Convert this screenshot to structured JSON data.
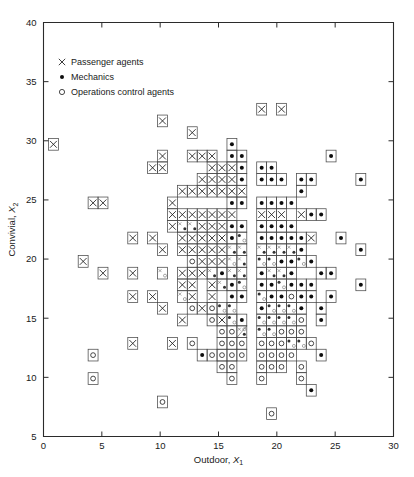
{
  "figure": {
    "kind": "scatter-plot",
    "background": "#ffffff"
  },
  "axes": {
    "x": {
      "label_text": "Outdoor, ",
      "label_var": "X",
      "label_sub": "1",
      "min": 0,
      "max": 30,
      "ticks": [
        0,
        5,
        10,
        15,
        20,
        25,
        30
      ],
      "ticklabels": [
        "0",
        "5",
        "10",
        "15",
        "20",
        "25",
        "30"
      ]
    },
    "y": {
      "label_text": "Convivial, ",
      "label_var": "X",
      "label_sub": "2",
      "min": 5,
      "max": 40,
      "ticks": [
        5,
        10,
        15,
        20,
        25,
        30,
        35,
        40
      ],
      "ticklabels": [
        "5",
        "10",
        "15",
        "20",
        "25",
        "30",
        "35",
        "40"
      ]
    }
  },
  "legend": {
    "items": [
      {
        "marker": "cross-marker",
        "label": "Passenger agents"
      },
      {
        "marker": "filled-dot-marker",
        "label": "Mechanics"
      },
      {
        "marker": "open-circle-marker",
        "label": "Operations control agents"
      }
    ]
  },
  "chart_data": {
    "type": "scatter",
    "title": "",
    "xlabel": "Outdoor, X1",
    "ylabel": "Convivial, X2",
    "xlim": [
      0,
      30
    ],
    "ylim": [
      5,
      40
    ],
    "grid": false,
    "legend_position": "upper-left-inside",
    "cell_size": {
      "x": 0.85,
      "y": 0.99
    },
    "note": "Each plotted cell is drawn as a small open square containing one or more group markers; overlapping cells indicate multiple observations at that location.",
    "series": [
      {
        "name": "Passenger agents",
        "marker": "x",
        "points": [
          [
            1.0,
            30.0
          ],
          [
            10.0,
            31.9
          ],
          [
            10.0,
            29.0
          ],
          [
            9.1,
            28.0
          ],
          [
            10.0,
            28.0
          ],
          [
            12.9,
            31.0
          ],
          [
            12.9,
            29.0
          ],
          [
            13.8,
            29.0
          ],
          [
            14.7,
            29.0
          ],
          [
            14.7,
            28.0
          ],
          [
            15.6,
            28.0
          ],
          [
            16.5,
            28.0
          ],
          [
            18.4,
            32.9
          ],
          [
            20.3,
            32.9
          ],
          [
            4.0,
            25.0
          ],
          [
            4.9,
            25.0
          ],
          [
            13.8,
            27.0
          ],
          [
            14.7,
            27.0
          ],
          [
            15.6,
            27.0
          ],
          [
            16.5,
            27.0
          ],
          [
            11.0,
            25.0
          ],
          [
            12.0,
            26.0
          ],
          [
            12.9,
            26.0
          ],
          [
            13.8,
            26.0
          ],
          [
            14.7,
            26.0
          ],
          [
            15.6,
            26.0
          ],
          [
            16.5,
            26.0
          ],
          [
            17.4,
            26.0
          ],
          [
            11.0,
            24.0
          ],
          [
            12.0,
            24.0
          ],
          [
            12.9,
            24.0
          ],
          [
            13.8,
            24.0
          ],
          [
            14.7,
            24.0
          ],
          [
            15.6,
            24.0
          ],
          [
            16.5,
            24.0
          ],
          [
            11.0,
            23.0
          ],
          [
            12.0,
            23.0
          ],
          [
            12.9,
            23.0
          ],
          [
            13.8,
            23.0
          ],
          [
            14.7,
            23.0
          ],
          [
            15.6,
            23.0
          ],
          [
            18.4,
            24.0
          ],
          [
            19.3,
            24.0
          ],
          [
            20.2,
            24.0
          ],
          [
            22.1,
            24.0
          ],
          [
            3.0,
            20.0
          ],
          [
            8.0,
            22.0
          ],
          [
            9.1,
            22.0
          ],
          [
            10.0,
            21.0
          ],
          [
            11.9,
            22.0
          ],
          [
            12.9,
            22.0
          ],
          [
            13.8,
            22.0
          ],
          [
            14.7,
            22.0
          ],
          [
            15.6,
            22.0
          ],
          [
            11.9,
            21.0
          ],
          [
            12.9,
            21.0
          ],
          [
            13.8,
            21.0
          ],
          [
            14.7,
            21.0
          ],
          [
            15.6,
            21.0
          ],
          [
            16.5,
            21.0
          ],
          [
            17.4,
            21.0
          ],
          [
            18.4,
            21.0
          ],
          [
            13.8,
            20.0
          ],
          [
            14.7,
            20.0
          ],
          [
            15.6,
            20.0
          ],
          [
            16.5,
            20.0
          ],
          [
            17.4,
            20.0
          ],
          [
            19.3,
            21.0
          ],
          [
            20.2,
            21.0
          ],
          [
            21.2,
            21.0
          ],
          [
            23.0,
            22.0
          ],
          [
            5.0,
            19.0
          ],
          [
            8.0,
            19.0
          ],
          [
            10.0,
            19.0
          ],
          [
            12.0,
            19.0
          ],
          [
            12.9,
            19.0
          ],
          [
            13.8,
            19.0
          ],
          [
            14.7,
            19.0
          ],
          [
            16.5,
            19.0
          ],
          [
            17.4,
            19.0
          ],
          [
            12.0,
            18.0
          ],
          [
            12.9,
            18.0
          ],
          [
            14.7,
            18.0
          ],
          [
            15.6,
            18.0
          ],
          [
            19.3,
            19.0
          ],
          [
            20.2,
            19.0
          ],
          [
            8.0,
            17.0
          ],
          [
            9.1,
            17.0
          ],
          [
            12.0,
            17.0
          ],
          [
            13.0,
            17.0
          ],
          [
            14.7,
            17.0
          ],
          [
            10.0,
            16.0
          ],
          [
            13.8,
            16.0
          ],
          [
            12.0,
            15.0
          ],
          [
            15.6,
            15.0
          ],
          [
            17.4,
            14.0
          ],
          [
            8.0,
            13.0
          ],
          [
            11.0,
            13.0
          ]
        ]
      },
      {
        "name": "Mechanics",
        "marker": "dot",
        "points": [
          [
            16.5,
            29.0
          ],
          [
            17.4,
            29.0
          ],
          [
            18.4,
            28.0
          ],
          [
            17.4,
            28.0
          ],
          [
            19.3,
            28.0
          ],
          [
            25.0,
            29.0
          ],
          [
            16.5,
            30.0
          ],
          [
            17.4,
            27.0
          ],
          [
            18.4,
            27.0
          ],
          [
            19.3,
            27.0
          ],
          [
            20.2,
            27.0
          ],
          [
            22.1,
            27.0
          ],
          [
            23.0,
            27.0
          ],
          [
            16.5,
            25.0
          ],
          [
            17.4,
            25.0
          ],
          [
            18.4,
            25.0
          ],
          [
            19.3,
            25.0
          ],
          [
            20.2,
            25.0
          ],
          [
            21.2,
            25.0
          ],
          [
            22.1,
            26.0
          ],
          [
            26.9,
            27.0
          ],
          [
            12.0,
            23.0
          ],
          [
            12.9,
            23.0
          ],
          [
            16.5,
            23.0
          ],
          [
            17.4,
            23.0
          ],
          [
            18.4,
            23.0
          ],
          [
            19.3,
            23.0
          ],
          [
            20.2,
            23.0
          ],
          [
            21.2,
            23.0
          ],
          [
            16.5,
            22.0
          ],
          [
            17.4,
            22.0
          ],
          [
            18.4,
            22.0
          ],
          [
            19.3,
            22.0
          ],
          [
            20.2,
            22.0
          ],
          [
            21.2,
            22.0
          ],
          [
            22.1,
            22.0
          ],
          [
            23.0,
            24.0
          ],
          [
            24.0,
            24.0
          ],
          [
            16.5,
            21.0
          ],
          [
            17.4,
            21.0
          ],
          [
            18.4,
            21.0
          ],
          [
            19.3,
            21.0
          ],
          [
            20.2,
            21.0
          ],
          [
            21.2,
            21.0
          ],
          [
            22.1,
            21.0
          ],
          [
            17.4,
            20.0
          ],
          [
            18.4,
            20.0
          ],
          [
            19.3,
            20.0
          ],
          [
            20.2,
            20.0
          ],
          [
            21.2,
            20.0
          ],
          [
            22.1,
            20.0
          ],
          [
            23.0,
            20.0
          ],
          [
            14.7,
            19.0
          ],
          [
            15.6,
            19.0
          ],
          [
            16.5,
            19.0
          ],
          [
            17.4,
            19.0
          ],
          [
            18.4,
            19.0
          ],
          [
            19.3,
            19.0
          ],
          [
            20.2,
            19.0
          ],
          [
            21.2,
            19.0
          ],
          [
            15.6,
            18.0
          ],
          [
            16.5,
            18.0
          ],
          [
            17.4,
            18.0
          ],
          [
            18.4,
            18.0
          ],
          [
            19.3,
            18.0
          ],
          [
            20.2,
            18.0
          ],
          [
            21.2,
            18.0
          ],
          [
            22.1,
            18.0
          ],
          [
            23.0,
            18.0
          ],
          [
            24.0,
            19.0
          ],
          [
            16.5,
            17.0
          ],
          [
            17.4,
            17.0
          ],
          [
            18.4,
            17.0
          ],
          [
            19.3,
            17.0
          ],
          [
            20.2,
            17.0
          ],
          [
            22.1,
            17.0
          ],
          [
            23.0,
            17.0
          ],
          [
            15.6,
            16.0
          ],
          [
            16.5,
            16.0
          ],
          [
            18.4,
            16.0
          ],
          [
            19.3,
            16.0
          ],
          [
            20.2,
            16.0
          ],
          [
            21.2,
            16.0
          ],
          [
            22.1,
            16.0
          ],
          [
            24.0,
            16.0
          ],
          [
            16.5,
            15.0
          ],
          [
            17.4,
            15.0
          ],
          [
            18.4,
            15.0
          ],
          [
            19.3,
            15.0
          ],
          [
            20.2,
            15.0
          ],
          [
            21.2,
            15.0
          ],
          [
            23.9,
            15.0
          ],
          [
            17.4,
            14.0
          ],
          [
            18.4,
            14.0
          ],
          [
            19.3,
            14.0
          ],
          [
            21.2,
            13.0
          ],
          [
            22.1,
            13.0
          ],
          [
            24.0,
            12.0
          ],
          [
            23.0,
            9.0
          ],
          [
            25.9,
            22.0
          ],
          [
            26.9,
            21.0
          ],
          [
            26.9,
            18.0
          ],
          [
            25.0,
            19.0
          ],
          [
            24.9,
            17.0
          ],
          [
            13.8,
            12.0
          ]
        ]
      },
      {
        "name": "Operations control agents",
        "marker": "circle",
        "points": [
          [
            10.0,
            19.0
          ],
          [
            12.0,
            17.0
          ],
          [
            13.0,
            16.0
          ],
          [
            14.7,
            16.0
          ],
          [
            15.6,
            16.0
          ],
          [
            16.5,
            16.0
          ],
          [
            19.3,
            16.0
          ],
          [
            20.2,
            16.0
          ],
          [
            21.2,
            16.0
          ],
          [
            14.7,
            15.0
          ],
          [
            16.5,
            15.0
          ],
          [
            18.4,
            15.0
          ],
          [
            19.3,
            15.0
          ],
          [
            20.2,
            15.0
          ],
          [
            21.2,
            15.0
          ],
          [
            22.1,
            15.0
          ],
          [
            15.6,
            14.0
          ],
          [
            16.5,
            14.0
          ],
          [
            17.4,
            14.0
          ],
          [
            18.4,
            14.0
          ],
          [
            19.3,
            14.0
          ],
          [
            20.2,
            14.0
          ],
          [
            21.2,
            14.0
          ],
          [
            22.1,
            14.0
          ],
          [
            13.0,
            13.0
          ],
          [
            15.6,
            13.0
          ],
          [
            16.5,
            13.0
          ],
          [
            17.4,
            13.0
          ],
          [
            18.4,
            13.0
          ],
          [
            19.3,
            13.0
          ],
          [
            20.2,
            13.0
          ],
          [
            21.2,
            13.0
          ],
          [
            22.1,
            13.0
          ],
          [
            3.9,
            12.0
          ],
          [
            14.7,
            12.0
          ],
          [
            15.6,
            12.0
          ],
          [
            16.5,
            12.0
          ],
          [
            17.4,
            12.0
          ],
          [
            18.4,
            12.0
          ],
          [
            19.3,
            12.0
          ],
          [
            21.2,
            12.0
          ],
          [
            3.9,
            10.0
          ],
          [
            15.6,
            11.0
          ],
          [
            16.5,
            11.0
          ],
          [
            18.4,
            11.0
          ],
          [
            19.3,
            11.0
          ],
          [
            20.2,
            11.0
          ],
          [
            22.1,
            11.0
          ],
          [
            16.5,
            10.0
          ],
          [
            18.4,
            10.0
          ],
          [
            22.1,
            10.0
          ],
          [
            10.0,
            8.0
          ],
          [
            19.3,
            7.0
          ],
          [
            18.4,
            17.0
          ],
          [
            20.2,
            18.0
          ],
          [
            21.2,
            17.0
          ],
          [
            17.4,
            18.0
          ],
          [
            16.5,
            20.0
          ],
          [
            12.9,
            20.0
          ],
          [
            17.4,
            22.0
          ],
          [
            22.1,
            20.0
          ],
          [
            19.3,
            20.0
          ],
          [
            18.4,
            20.0
          ],
          [
            20.2,
            12.0
          ],
          [
            23.0,
            13.0
          ]
        ]
      }
    ]
  }
}
